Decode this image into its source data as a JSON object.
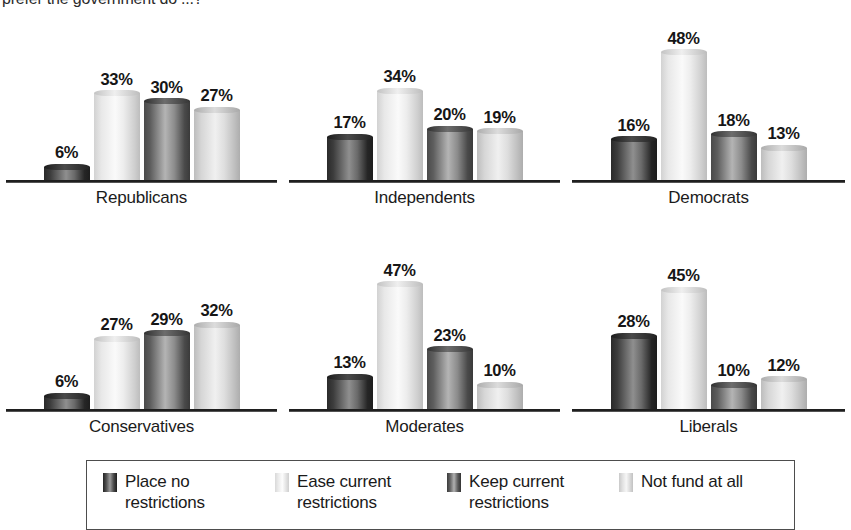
{
  "title": {
    "text": "prefer the government do ...?"
  },
  "legend": {
    "items": [
      {
        "label_line1": "Place no",
        "label_line2": "restrictions",
        "swatch": "series-0-swatch"
      },
      {
        "label_line1": "Ease current",
        "label_line2": "restrictions",
        "swatch": "series-1-swatch"
      },
      {
        "label_line1": "Keep current",
        "label_line2": "restrictions",
        "swatch": "series-2-swatch"
      },
      {
        "label_line1": "Not fund at all",
        "label_line2": "",
        "swatch": "series-3-swatch"
      }
    ]
  },
  "chart_data": {
    "type": "bar",
    "title": "prefer the government do ...?",
    "xlabel": "",
    "ylabel": "",
    "ylim": [
      0,
      50
    ],
    "grid": false,
    "legend_position": "bottom",
    "value_suffix": "%",
    "series_names": [
      "Place no restrictions",
      "Ease current restrictions",
      "Keep current restrictions",
      "Not fund at all"
    ],
    "categories": [
      "Republicans",
      "Independents",
      "Democrats",
      "Conservatives",
      "Moderates",
      "Liberals"
    ],
    "panels": [
      {
        "category": "Republicans",
        "values": [
          6,
          33,
          30,
          27
        ],
        "labels": [
          "6%",
          "33%",
          "30%",
          "27%"
        ]
      },
      {
        "category": "Independents",
        "values": [
          17,
          34,
          20,
          19
        ],
        "labels": [
          "17%",
          "34%",
          "20%",
          "19%"
        ]
      },
      {
        "category": "Democrats",
        "values": [
          16,
          48,
          18,
          13
        ],
        "labels": [
          "16%",
          "48%",
          "18%",
          "13%"
        ]
      },
      {
        "category": "Conservatives",
        "values": [
          6,
          27,
          29,
          32
        ],
        "labels": [
          "6%",
          "27%",
          "29%",
          "32%"
        ]
      },
      {
        "category": "Moderates",
        "values": [
          13,
          47,
          23,
          10
        ],
        "labels": [
          "13%",
          "47%",
          "23%",
          "10%"
        ]
      },
      {
        "category": "Liberals",
        "values": [
          28,
          45,
          10,
          12
        ],
        "labels": [
          "28%",
          "45%",
          "10%",
          "12%"
        ]
      }
    ],
    "series": [
      {
        "name": "Place no restrictions",
        "values": [
          6,
          17,
          16,
          6,
          13,
          28
        ]
      },
      {
        "name": "Ease current restrictions",
        "values": [
          33,
          34,
          48,
          27,
          47,
          45
        ]
      },
      {
        "name": "Keep current restrictions",
        "values": [
          30,
          20,
          18,
          29,
          23,
          10
        ]
      },
      {
        "name": "Not fund at all",
        "values": [
          27,
          19,
          13,
          32,
          10,
          12
        ]
      }
    ],
    "colors": {
      "series0": "#3d3d3d",
      "series1": "#ededed",
      "series2": "#8c8c8c",
      "series3": "#dcdcdc",
      "axis": "#1f1f1f",
      "text": "#1a1a1a"
    }
  }
}
